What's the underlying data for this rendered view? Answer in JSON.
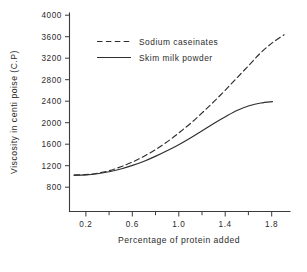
{
  "chart_data": {
    "type": "line",
    "title": "",
    "xlabel": "Percentage of protein added",
    "ylabel": "Viscosity in centi poise (C.P)",
    "xlim": [
      0.06,
      1.95
    ],
    "ylim": [
      450,
      4000
    ],
    "grid": false,
    "legend_position": "upper-left-inside",
    "x_ticks_major": [
      0.2,
      0.6,
      1.0,
      1.4,
      1.8
    ],
    "x_tick_labels": [
      "0.2",
      "0.6",
      "1.0",
      "1.4",
      "1.8"
    ],
    "x_ticks_minor": [
      0.4,
      0.8,
      1.2,
      1.6
    ],
    "y_ticks": [
      800,
      1200,
      1600,
      2000,
      2400,
      2800,
      3200,
      3600,
      4000
    ],
    "y_tick_labels": [
      "800",
      "1200",
      "1600",
      "2000",
      "2400",
      "2800",
      "3200",
      "3600",
      "4000"
    ],
    "series": [
      {
        "name": "Sodium caseinates",
        "style": "dashed",
        "color": "#2e2e2e",
        "x": [
          0.1,
          0.2,
          0.3,
          0.4,
          0.5,
          0.6,
          0.7,
          0.8,
          0.9,
          1.0,
          1.1,
          1.2,
          1.3,
          1.4,
          1.5,
          1.6,
          1.7,
          1.8,
          1.9
        ],
        "values": [
          1100,
          1110,
          1135,
          1180,
          1250,
          1335,
          1440,
          1560,
          1700,
          1860,
          2030,
          2220,
          2420,
          2630,
          2850,
          3070,
          3290,
          3470,
          3610
        ]
      },
      {
        "name": "Skim milk powder",
        "style": "solid",
        "color": "#2e2e2e",
        "x": [
          0.1,
          0.2,
          0.3,
          0.4,
          0.5,
          0.6,
          0.7,
          0.8,
          0.9,
          1.0,
          1.1,
          1.2,
          1.3,
          1.4,
          1.5,
          1.6,
          1.7,
          1.8
        ],
        "values": [
          1100,
          1105,
          1125,
          1160,
          1210,
          1275,
          1350,
          1440,
          1540,
          1650,
          1770,
          1900,
          2030,
          2150,
          2260,
          2340,
          2390,
          2415
        ]
      }
    ]
  },
  "legend": {
    "entries": [
      {
        "label": "Sodium caseinates",
        "style": "dashed"
      },
      {
        "label": "Skim milk powder",
        "style": "solid"
      }
    ]
  },
  "axes": {
    "x_title": "Percentage of protein added",
    "y_title": "Viscosity in centi poise (C.P)"
  },
  "colors": {
    "line": "#2e2e2e",
    "axis": "#3b3b3b",
    "text": "#2b2b2b",
    "background": "#ffffff"
  }
}
